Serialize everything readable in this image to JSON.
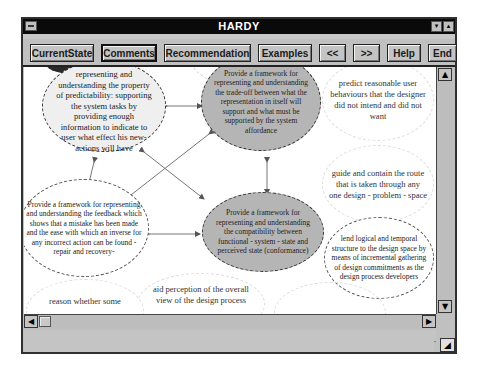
{
  "window": {
    "title": "HARDY",
    "controls": {
      "minimize": "▾",
      "maximize": "▴"
    }
  },
  "toolbar": {
    "buttons": [
      {
        "label": "CurrentState"
      },
      {
        "label": "Comments"
      },
      {
        "label": "Recommendation"
      },
      {
        "label": "Examples"
      },
      {
        "label": "<<"
      },
      {
        "label": ">>"
      },
      {
        "label": "Help"
      },
      {
        "label": "End"
      }
    ],
    "active": "Comments"
  },
  "diagram": {
    "nodes": [
      {
        "id": "predictability",
        "style": "light",
        "text": "provide a framework for representing and understanding the property of predictability: supporting the system tasks by providing enough information to indicate to user what effect his new- actions will have"
      },
      {
        "id": "tradeoff",
        "style": "dark",
        "text": "Provide a framework for representing and understanding the trade-off between what the representation in itself will support and what must be supported by the system affordance"
      },
      {
        "id": "feedback",
        "style": "white",
        "text": "Provide a framework for representing and understanding the feedback which shows that a mistake has been made and the ease with which an inverse for any incorrect action can be found -repair and recovery-"
      },
      {
        "id": "compatibility",
        "style": "dark",
        "text": "Provide a framework for representing and understanding the compatibility between functional - system - state and perceived state (conformance)"
      },
      {
        "id": "predict-behaviours",
        "style": "faint",
        "text": "predict reasonable user behaviours that the designer did not intend and did not want"
      },
      {
        "id": "guide-route",
        "style": "faint",
        "text": "guide and contain the route that is taken through any one design - problem - space"
      },
      {
        "id": "logical-structure",
        "style": "white",
        "text": "lend logical and temporal structure to the design space by means of incremental gathering of design commitments as the design process developers"
      },
      {
        "id": "aid-perception",
        "style": "faint",
        "text": "aid perception of the overall view of the design process"
      },
      {
        "id": "reason-whether",
        "style": "faint",
        "text": "reason whether some"
      }
    ]
  },
  "colors": {
    "titlebar": "#0a0a0a",
    "chrome": "#c0c0c0",
    "node_dark": "#b5b5b5",
    "node_light": "#efefef"
  }
}
